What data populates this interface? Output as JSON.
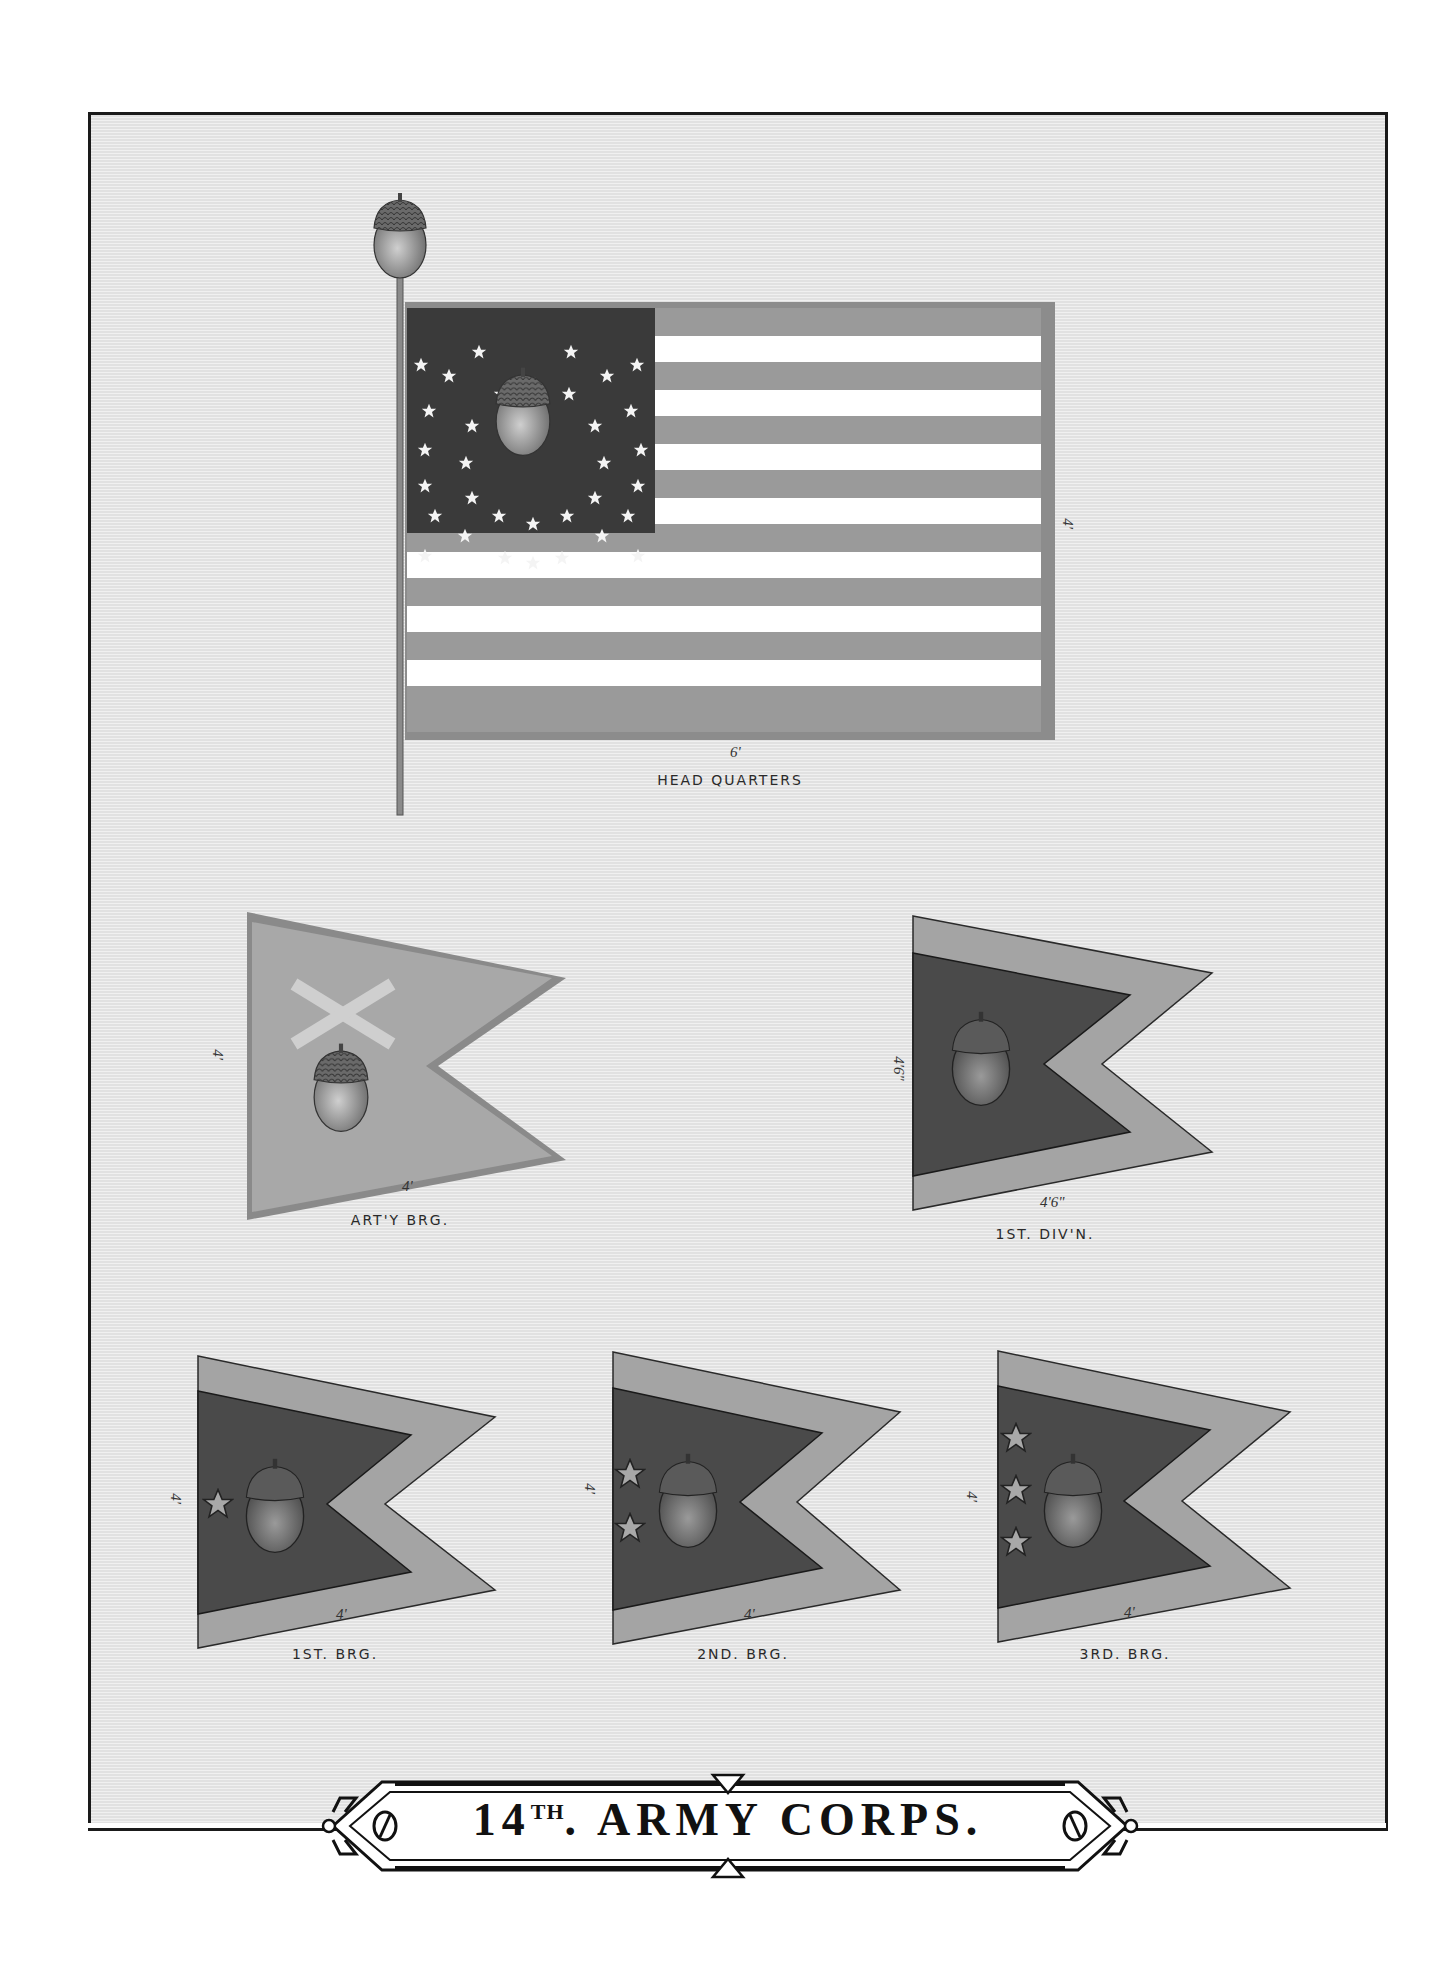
{
  "plate": {
    "title": "14TH ARMY CORPS.",
    "title_number": "14",
    "title_suffix": "TH",
    "title_rest": ". ARMY CORPS.",
    "colors": {
      "paper": "#e8e8e8",
      "frame": "#1a1a1a",
      "stripe_dark": "#9a9a9a",
      "stripe_light": "#ffffff",
      "canton": "#3a3a3a",
      "pennant_outer": "#a4a4a4",
      "pennant_inner": "#4a4a4a",
      "artillery_field": "#a8a8a8",
      "cross": "#cfcfcf"
    }
  },
  "flags": [
    {
      "id": "headquarters",
      "label": "HEAD QUARTERS",
      "type": "national-flag",
      "width_dim": "6'",
      "height_dim": "4'",
      "stars": 34,
      "emblem": "acorn",
      "finial": "acorn"
    },
    {
      "id": "artillery-brigade",
      "label": "ART'Y BRG.",
      "type": "swallowtail-guidon",
      "width_dim": "4'",
      "height_dim": "4'",
      "emblem": "acorn",
      "device": "crossed-cannons"
    },
    {
      "id": "1st-division",
      "label": "1ST. DIV'N.",
      "type": "swallowtail-bordered",
      "width_dim": "4'6\"",
      "height_dim": "4'6\"",
      "emblem": "acorn",
      "stars": 0
    },
    {
      "id": "1st-brigade",
      "label": "1ST. BRG.",
      "type": "swallowtail-bordered",
      "width_dim": "4'",
      "height_dim": "4'",
      "emblem": "acorn",
      "stars": 1
    },
    {
      "id": "2nd-brigade",
      "label": "2ND. BRG.",
      "type": "swallowtail-bordered",
      "width_dim": "4'",
      "height_dim": "4'",
      "emblem": "acorn",
      "stars": 2
    },
    {
      "id": "3rd-brigade",
      "label": "3RD. BRG.",
      "type": "swallowtail-bordered",
      "width_dim": "4'",
      "height_dim": "4'",
      "emblem": "acorn",
      "stars": 3
    }
  ]
}
